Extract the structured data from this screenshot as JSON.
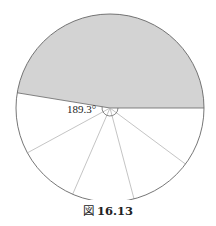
{
  "figure": {
    "caption_prefix": "図",
    "caption_number": "16.13",
    "angle_label": "189.3°"
  },
  "diagram": {
    "type": "circle-sector",
    "center": [
      110,
      108
    ],
    "radius": 94,
    "shaded_sector": {
      "start_angle_deg": 0,
      "end_angle_deg": 170.7,
      "fill": "#d3d3d3"
    },
    "unshaded_sector": {
      "angle_deg": 189.3,
      "fill": "#ffffff"
    },
    "spoke_angles_deg": [
      208.5,
      246.6,
      284.8,
      323.4
    ],
    "stroke_color": "#666666",
    "spoke_color": "#aaaaaa"
  }
}
